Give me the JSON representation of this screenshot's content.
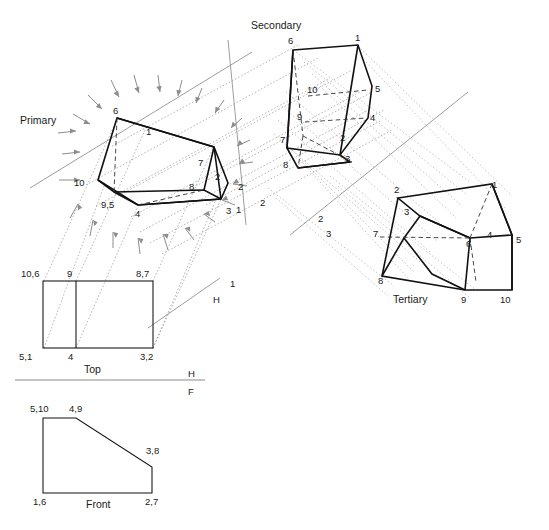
{
  "drawing": {
    "title_labels": {
      "primary": "Primary",
      "secondary": "Secondary",
      "tertiary": "Tertiary",
      "top": "Top",
      "front": "Front"
    },
    "reference_line_labels": {
      "h_upper": "H",
      "h_lower": "H",
      "f_lower": "F",
      "fold_1": "1"
    },
    "auxiliary_plane_labels": [
      {
        "name": "aux-1-left",
        "text": "1"
      },
      {
        "name": "aux-2-left",
        "text": "2"
      },
      {
        "name": "aux-2-mid",
        "text": "2"
      },
      {
        "name": "aux-2-right",
        "text": "2"
      },
      {
        "name": "aux-3-right",
        "text": "3"
      }
    ],
    "primary_view": {
      "name": "Primary",
      "vertex_labels": [
        {
          "id": "6",
          "text": "6"
        },
        {
          "id": "1",
          "text": "1"
        },
        {
          "id": "7",
          "text": "7"
        },
        {
          "id": "8",
          "text": "8"
        },
        {
          "id": "2",
          "text": "2"
        },
        {
          "id": "3",
          "text": "3"
        },
        {
          "id": "4",
          "text": "4"
        },
        {
          "id": "9.5",
          "text": "9,5"
        },
        {
          "id": "10",
          "text": "10"
        }
      ]
    },
    "secondary_view": {
      "name": "Secondary",
      "vertex_labels": [
        {
          "id": "6",
          "text": "6"
        },
        {
          "id": "1",
          "text": "1"
        },
        {
          "id": "10",
          "text": "10"
        },
        {
          "id": "5",
          "text": "5"
        },
        {
          "id": "9",
          "text": "9"
        },
        {
          "id": "4",
          "text": "4"
        },
        {
          "id": "7",
          "text": "7"
        },
        {
          "id": "2",
          "text": "2"
        },
        {
          "id": "8",
          "text": "8"
        },
        {
          "id": "3",
          "text": "3"
        }
      ]
    },
    "tertiary_view": {
      "name": "Tertiary",
      "vertex_labels": [
        {
          "id": "2",
          "text": "2"
        },
        {
          "id": "1",
          "text": "1"
        },
        {
          "id": "3",
          "text": "3"
        },
        {
          "id": "7",
          "text": "7"
        },
        {
          "id": "4",
          "text": "4"
        },
        {
          "id": "5",
          "text": "5"
        },
        {
          "id": "6",
          "text": "6"
        },
        {
          "id": "8",
          "text": "8"
        },
        {
          "id": "9",
          "text": "9"
        },
        {
          "id": "10",
          "text": "10"
        }
      ]
    },
    "top_view": {
      "name": "Top",
      "vertex_labels": [
        {
          "id": "10-6",
          "text": "10,6"
        },
        {
          "id": "9",
          "text": "9"
        },
        {
          "id": "8-7",
          "text": "8,7"
        },
        {
          "id": "5-1",
          "text": "5,1"
        },
        {
          "id": "4",
          "text": "4"
        },
        {
          "id": "3-2",
          "text": "3,2"
        }
      ]
    },
    "front_view": {
      "name": "Front",
      "vertex_labels": [
        {
          "id": "5-10",
          "text": "5,10"
        },
        {
          "id": "4-9",
          "text": "4,9"
        },
        {
          "id": "3-8",
          "text": "3,8"
        },
        {
          "id": "1-6",
          "text": "1,6"
        },
        {
          "id": "2-7",
          "text": "2,7"
        }
      ]
    },
    "colors": {
      "object_edge": "#111111",
      "hidden_edge": "#333333",
      "projection_line": "#8a8a8a",
      "arrow": "#8d8d8d",
      "background": "#ffffff"
    }
  }
}
